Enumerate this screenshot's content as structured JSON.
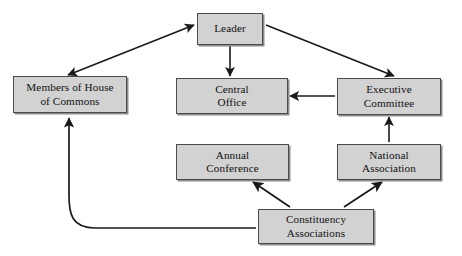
{
  "diagram": {
    "background_color": "#ffffff",
    "node_fill_color": "#d2d2d2",
    "node_border_color": "#4a4a4a",
    "edge_color": "#1a1a1a",
    "nodes": [
      {
        "id": "leader",
        "label": "Leader"
      },
      {
        "id": "members",
        "label": "Members of House\nof Commons"
      },
      {
        "id": "central_office",
        "label": "Central\nOffice"
      },
      {
        "id": "exec_committee",
        "label": "Executive\nCommittee"
      },
      {
        "id": "annual_conference",
        "label": "Annual\nConference"
      },
      {
        "id": "national_assoc",
        "label": "National\nAssociation"
      },
      {
        "id": "constituency",
        "label": "Constituency\nAssociations"
      }
    ],
    "edges": [
      {
        "from": "leader",
        "to": "members",
        "style": "straight",
        "heads": "both"
      },
      {
        "from": "leader",
        "to": "central_office",
        "style": "straight",
        "heads": "end"
      },
      {
        "from": "leader",
        "to": "exec_committee",
        "style": "straight",
        "heads": "end"
      },
      {
        "from": "exec_committee",
        "to": "central_office",
        "style": "straight",
        "heads": "end"
      },
      {
        "from": "national_assoc",
        "to": "exec_committee",
        "style": "straight",
        "heads": "end"
      },
      {
        "from": "constituency",
        "to": "annual_conference",
        "style": "straight",
        "heads": "end"
      },
      {
        "from": "constituency",
        "to": "national_assoc",
        "style": "straight",
        "heads": "end"
      },
      {
        "from": "constituency",
        "to": "members",
        "style": "curved",
        "heads": "end"
      }
    ]
  }
}
